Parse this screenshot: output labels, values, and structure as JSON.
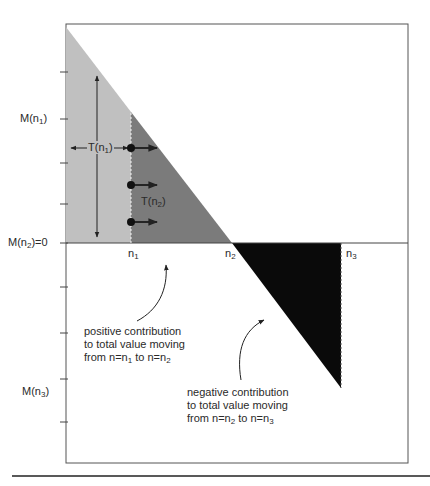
{
  "colors": {
    "frame": "#555555",
    "light_region": "#c0c0c0",
    "dark_region": "#7b7b7b",
    "negative_region": "#0a0a0a",
    "line": "#222222",
    "background": "#ffffff"
  },
  "y_axis": {
    "labels": [
      {
        "id": "M_n1",
        "base": "M(n",
        "sub": "1",
        "tail": ")"
      },
      {
        "id": "M_n2",
        "base": "M(n",
        "sub": "2",
        "tail": ")=0"
      },
      {
        "id": "M_n3",
        "base": "M(n",
        "sub": "3",
        "tail": ")"
      }
    ],
    "tick_count_above_axis": 4,
    "tick_count_below_axis": 4
  },
  "x_axis": {
    "labels": [
      {
        "id": "n1",
        "base": "n",
        "sub": "1"
      },
      {
        "id": "n2",
        "base": "n",
        "sub": "2"
      },
      {
        "id": "n3",
        "base": "n",
        "sub": "3"
      }
    ]
  },
  "regions": {
    "T_n1": {
      "base": "T(n",
      "sub": "1",
      "tail": ")"
    },
    "T_n2": {
      "base": "T(n",
      "sub": "2",
      "tail": ")"
    }
  },
  "annotations": {
    "positive": {
      "line1": "positive contribution",
      "line2": "to total value moving",
      "line3_parts": {
        "a": "from n=n",
        "a_sub": "1",
        "b": " to n=n",
        "b_sub": "2"
      }
    },
    "negative": {
      "line1": "negative contribution",
      "line2": "to total value moving",
      "line3_parts": {
        "a": "from n=n",
        "a_sub": "2",
        "b": " to n=n",
        "b_sub": "3"
      }
    }
  },
  "markers": {
    "dot_count": 3
  }
}
